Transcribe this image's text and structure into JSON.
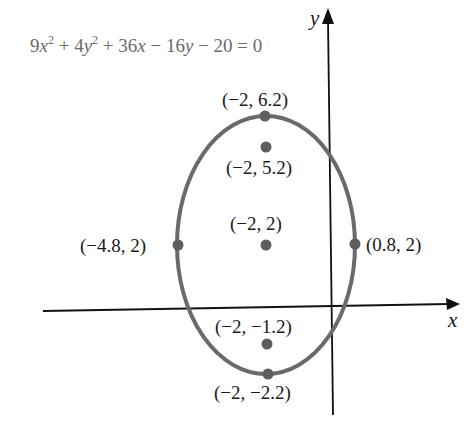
{
  "equation": {
    "parts": [
      {
        "text": "9",
        "style": "normal"
      },
      {
        "text": "x",
        "style": "var"
      },
      {
        "text": "2",
        "style": "sup"
      },
      {
        "text": " + 4",
        "style": "normal"
      },
      {
        "text": "y",
        "style": "var"
      },
      {
        "text": "2",
        "style": "sup"
      },
      {
        "text": " + 36",
        "style": "normal"
      },
      {
        "text": "x",
        "style": "var"
      },
      {
        "text": " − 16",
        "style": "normal"
      },
      {
        "text": "y",
        "style": "var"
      },
      {
        "text": " − 20 = 0",
        "style": "normal"
      }
    ],
    "plain": "9x² + 4y² + 36x − 16y − 20 = 0"
  },
  "axes": {
    "x_label": "x",
    "y_label": "y"
  },
  "points": {
    "top_vertex": {
      "label": "(−2, 6.2)",
      "x": -2,
      "y": 6.2
    },
    "top_focus": {
      "label": "(−2, 5.2)",
      "x": -2,
      "y": 5.2
    },
    "center": {
      "label": "(−2, 2)",
      "x": -2,
      "y": 2
    },
    "left_vertex": {
      "label": "(−4.8, 2)",
      "x": -4.8,
      "y": 2
    },
    "right_vertex": {
      "label": "(0.8, 2)",
      "x": 0.8,
      "y": 2
    },
    "bottom_focus": {
      "label": "(−2, −1.2)",
      "x": -2,
      "y": -1.2
    },
    "bottom_vertex": {
      "label": "(−2, −2.2)",
      "x": -2,
      "y": -2.2
    }
  },
  "colors": {
    "curve": "#6a6a6a",
    "dots": "#5e5e5e",
    "axes": "#111111",
    "equation_text": "#6a6a6a",
    "label_text": "#1a1a1a"
  }
}
